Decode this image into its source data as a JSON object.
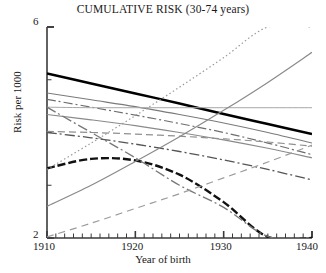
{
  "chart_data": {
    "type": "line",
    "title": "CUMULATIVE RISK (30-74 years)",
    "xlabel": "Year of birth",
    "ylabel": "Risk per 1000",
    "xlim": [
      1910,
      1940
    ],
    "ylim": [
      2,
      6
    ],
    "xticks": [
      1910,
      1920,
      1930,
      1940
    ],
    "xtick_labels": [
      "1910",
      "1920",
      "1930",
      "1940"
    ],
    "xminor_tick_step": 1,
    "yticks": [
      2,
      6
    ],
    "ytick_labels": [
      "2",
      "6"
    ],
    "grid": false,
    "legend": "none",
    "x": [
      1910,
      1915,
      1920,
      1925,
      1930,
      1935,
      1940
    ],
    "series": [
      {
        "name": "series-1",
        "style": "thick-solid-black",
        "color": "#000000",
        "values": [
          5.12,
          4.93,
          4.74,
          4.55,
          4.35,
          4.16,
          3.97
        ]
      },
      {
        "name": "series-2",
        "style": "thin-solid-gray",
        "color": "#7a7a7a",
        "values": [
          4.75,
          4.62,
          4.49,
          4.34,
          4.18,
          4.0,
          3.8
        ]
      },
      {
        "name": "series-3",
        "style": "dash-dot-gray",
        "color": "#6e6e6e",
        "values": [
          4.63,
          4.48,
          4.33,
          4.17,
          4.0,
          3.8,
          3.58
        ]
      },
      {
        "name": "series-4",
        "style": "thin-solid-light-gray-flat",
        "color": "#a8a8a8",
        "values": [
          4.48,
          4.47,
          4.47,
          4.47,
          4.47,
          4.47,
          4.47
        ]
      },
      {
        "name": "series-5",
        "style": "thin-solid-gray",
        "color": "#8a8a8a",
        "values": [
          4.34,
          4.24,
          4.13,
          4.0,
          3.86,
          3.7,
          3.52
        ]
      },
      {
        "name": "series-6",
        "style": "dashed-gray",
        "color": "#8f8f8f",
        "values": [
          4.02,
          4.0,
          3.97,
          3.93,
          3.88,
          3.82,
          3.74
        ]
      },
      {
        "name": "series-7",
        "style": "dash-dot-dark",
        "color": "#555555",
        "values": [
          4.0,
          3.9,
          3.78,
          3.64,
          3.48,
          3.3,
          3.1
        ]
      },
      {
        "name": "series-8",
        "style": "thick-dashed-black",
        "color": "#111111",
        "values": [
          3.32,
          3.5,
          3.47,
          3.2,
          2.68,
          2.02,
          2.0
        ]
      },
      {
        "name": "series-9",
        "style": "dash-dot-gray-descending",
        "color": "#777777",
        "values": [
          4.48,
          4.0,
          3.52,
          3.0,
          2.58,
          2.03,
          2.0
        ]
      },
      {
        "name": "series-10",
        "style": "thin-solid-gray-rising",
        "color": "#8a8a8a",
        "values": [
          2.6,
          3.0,
          3.45,
          3.92,
          4.42,
          4.95,
          5.52
        ]
      },
      {
        "name": "series-11",
        "style": "dotted-gray-rising",
        "color": "#9a9a9a",
        "values": [
          3.3,
          3.8,
          4.32,
          4.86,
          5.42,
          6.0,
          6.0
        ]
      },
      {
        "name": "series-12",
        "style": "long-dashed-gray-rising",
        "color": "#9c9c9c",
        "values": [
          2.02,
          2.28,
          2.56,
          2.84,
          3.14,
          3.44,
          3.76
        ]
      }
    ],
    "annotations": []
  }
}
